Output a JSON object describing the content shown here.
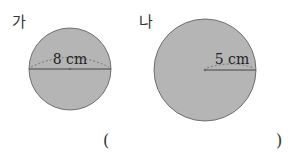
{
  "figures": [
    {
      "label": "가",
      "measure_text": "8 cm",
      "measure_type": "diameter",
      "fill": "#b3b3b3"
    },
    {
      "label": "나",
      "measure_text": "5 cm",
      "measure_type": "radius",
      "fill": "#b3b3b3"
    }
  ],
  "answer": {
    "open": "(",
    "close": ")",
    "value": ""
  }
}
